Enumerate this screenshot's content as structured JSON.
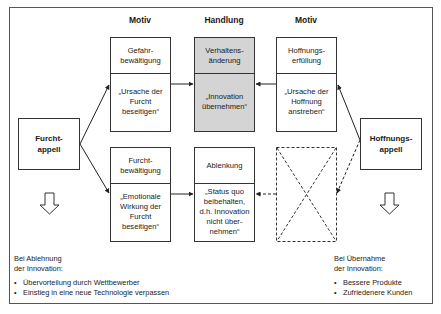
{
  "headers": {
    "motiv_left": "Motiv",
    "handlung": "Handlung",
    "motiv_right": "Motiv"
  },
  "appeals": {
    "fear": "Furcht-\nappell",
    "hope": "Hoffnungs-\nappell"
  },
  "boxes": {
    "gefahr": {
      "title": "Gefahr-\nbewältigung",
      "body": "„Ursache der\nFurcht\nbeseitigen“"
    },
    "furcht": {
      "title": "Furcht-\nbewältigung",
      "body": "„Emotionale\nWirkung der\nFurcht\nbeseitigen“"
    },
    "verhalten": {
      "title": "Verhaltens-\nänderung",
      "body": "„Innovation\nübernehmen“"
    },
    "ablenkung": {
      "title": "Ablenkung",
      "body": "„Status quo\nbeibehalten,\nd.h. Innovation\nnicht über-\nnehmen“"
    },
    "hoffnung": {
      "title": "Hoffnungs-\nerfüllung",
      "body": "„Ursache der\nHoffnung\nanstreben“"
    }
  },
  "notes": {
    "rejection": {
      "intro": "Bei Ablehnung\nder Innovation:",
      "items": [
        "Übervorteilung durch Wettbewerber",
        "Einstieg in eine neue Technologie verpassen"
      ]
    },
    "adoption": {
      "intro": "Bei Übernahme\nder Innovation:",
      "items": [
        "Bessere Produkte",
        "Zufriedenere Kunden"
      ]
    }
  },
  "colors": {
    "highlight_box": "#d4d4d4",
    "line": "#333333"
  }
}
